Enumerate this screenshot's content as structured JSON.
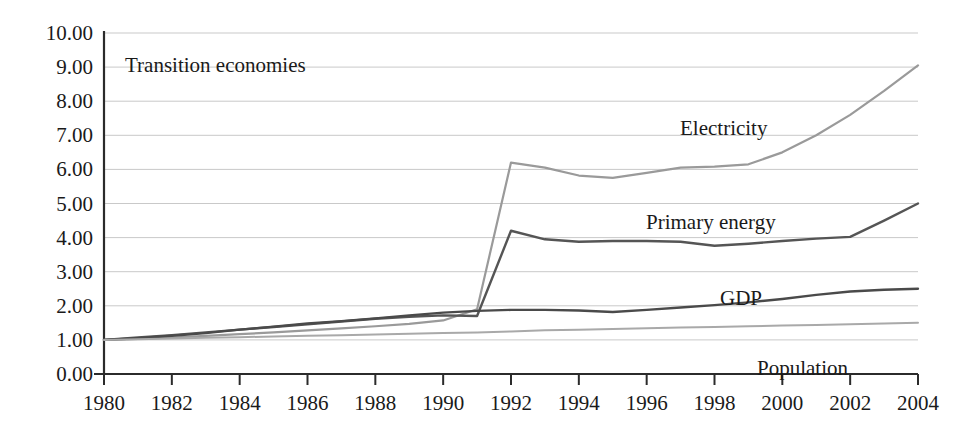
{
  "chart_data": {
    "type": "line",
    "title": "Transition economies",
    "xlabel": "",
    "ylabel": "",
    "xlim": [
      1980,
      2004
    ],
    "ylim": [
      0.0,
      10.0
    ],
    "grid": true,
    "legend_position": "inline-labels",
    "x_ticks": [
      "1980",
      "1982",
      "1984",
      "1986",
      "1988",
      "1990",
      "1992",
      "1994",
      "1996",
      "1998",
      "2000",
      "2002",
      "2004"
    ],
    "y_ticks": [
      "0.00",
      "1.00",
      "2.00",
      "3.00",
      "4.00",
      "5.00",
      "6.00",
      "7.00",
      "8.00",
      "9.00",
      "10.00"
    ],
    "x": [
      1980,
      1981,
      1982,
      1983,
      1984,
      1985,
      1986,
      1987,
      1988,
      1989,
      1990,
      1991,
      1992,
      1993,
      1994,
      1995,
      1996,
      1997,
      1998,
      1999,
      2000,
      2001,
      2002,
      2003,
      2004
    ],
    "series": [
      {
        "name": "Electricity",
        "color": "#9a9a9a",
        "width": 2.2,
        "label_x": 680,
        "label_y": 118,
        "values": [
          1.0,
          1.03,
          1.07,
          1.12,
          1.17,
          1.22,
          1.28,
          1.34,
          1.4,
          1.47,
          1.57,
          1.9,
          6.2,
          6.05,
          5.82,
          5.75,
          5.9,
          6.05,
          6.08,
          6.15,
          6.5,
          7.0,
          7.6,
          8.3,
          9.05
        ]
      },
      {
        "name": "Primary energy",
        "color": "#555555",
        "width": 2.4,
        "label_x": 646,
        "label_y": 212,
        "values": [
          1.0,
          1.07,
          1.14,
          1.22,
          1.3,
          1.38,
          1.46,
          1.54,
          1.62,
          1.68,
          1.72,
          1.7,
          4.2,
          3.95,
          3.88,
          3.9,
          3.9,
          3.88,
          3.76,
          3.82,
          3.9,
          3.97,
          4.02,
          4.5,
          5.0
        ]
      },
      {
        "name": "GDP",
        "color": "#4a4a4a",
        "width": 2.4,
        "label_x": 720,
        "label_y": 288,
        "values": [
          1.0,
          1.05,
          1.12,
          1.2,
          1.3,
          1.39,
          1.48,
          1.55,
          1.63,
          1.72,
          1.8,
          1.85,
          1.88,
          1.88,
          1.86,
          1.82,
          1.88,
          1.95,
          2.02,
          2.1,
          2.2,
          2.32,
          2.42,
          2.47,
          2.5
        ]
      },
      {
        "name": "Population",
        "color": "#a9a9a9",
        "width": 2.0,
        "label_x": 757,
        "label_y": 358,
        "values": [
          1.0,
          1.02,
          1.04,
          1.06,
          1.08,
          1.1,
          1.12,
          1.14,
          1.16,
          1.18,
          1.2,
          1.22,
          1.25,
          1.28,
          1.3,
          1.32,
          1.34,
          1.36,
          1.38,
          1.4,
          1.42,
          1.44,
          1.46,
          1.48,
          1.5
        ]
      }
    ],
    "axes": {
      "plot_left": 104,
      "plot_right": 918,
      "plot_top": 33,
      "plot_bottom": 374,
      "gridline_color": "#c9c9c9",
      "axis_color": "#2b2b2b"
    },
    "title_position": {
      "x": 125,
      "y": 55
    }
  }
}
